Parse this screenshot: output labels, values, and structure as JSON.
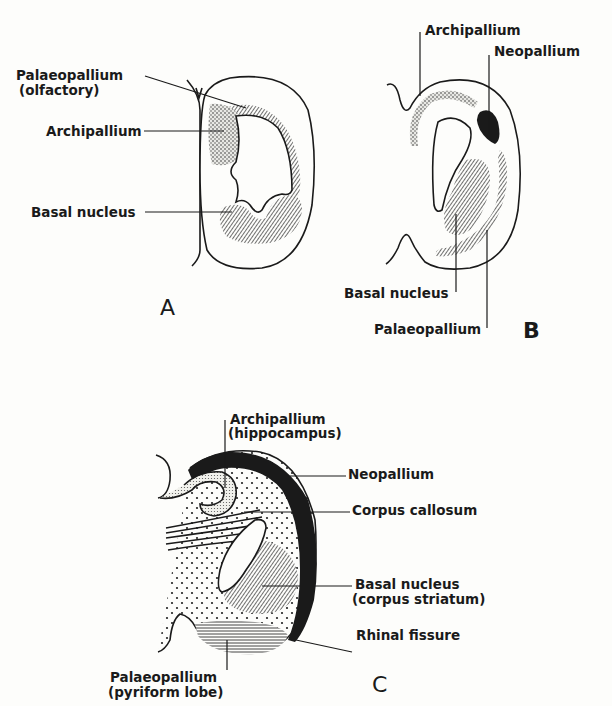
{
  "figure": {
    "panels": [
      {
        "id": "A",
        "letter": "A",
        "labels": {
          "palaeopallium": "Palaeopallium",
          "palaeopallium_sub": "(olfactory)",
          "archipallium": "Archipallium",
          "basal_nucleus": "Basal nucleus"
        }
      },
      {
        "id": "B",
        "letter": "B",
        "labels": {
          "archipallium": "Archipallium",
          "neopallium": "Neopallium",
          "basal_nucleus": "Basal nucleus",
          "palaeopallium": "Palaeopallium"
        }
      },
      {
        "id": "C",
        "letter": "C",
        "labels": {
          "archipallium": "Archipallium",
          "archipallium_sub": "(hippocampus)",
          "neopallium": "Neopallium",
          "corpus_callosum": "Corpus callosum",
          "basal_nucleus": "Basal nucleus",
          "basal_nucleus_sub": "(corpus striatum)",
          "rhinal_fissure": "Rhinal fissure",
          "palaeopallium": "Palaeopallium",
          "palaeopallium_sub": "(pyriform lobe)"
        }
      }
    ],
    "colors": {
      "ink": "#1a1a1a",
      "background": "#fdfdfb"
    }
  }
}
